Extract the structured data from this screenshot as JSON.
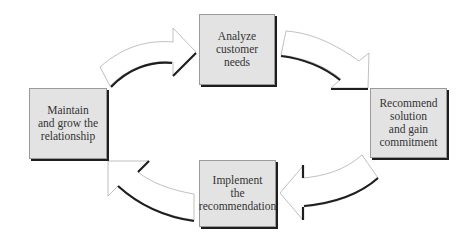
{
  "diagram": {
    "type": "cycle",
    "nodes": [
      {
        "id": "analyze",
        "lines": [
          "Analyze",
          "customer",
          "needs"
        ]
      },
      {
        "id": "recommend",
        "lines": [
          "Recommend",
          "solution",
          "and gain",
          "commitment"
        ]
      },
      {
        "id": "implement",
        "lines": [
          "Implement",
          "the",
          "recommendation"
        ]
      },
      {
        "id": "maintain",
        "lines": [
          "Maintain",
          "and grow the",
          "relationship"
        ]
      }
    ],
    "edges": [
      {
        "from": "maintain",
        "to": "analyze"
      },
      {
        "from": "analyze",
        "to": "recommend"
      },
      {
        "from": "recommend",
        "to": "implement"
      },
      {
        "from": "implement",
        "to": "maintain"
      }
    ],
    "colors": {
      "box_fill": "#e3e3e3",
      "box_border": "#9a9a9a",
      "shadow": "#1e1e1e",
      "arrow_fill": "#ffffff",
      "arrow_outline": "#b0b0b0"
    }
  }
}
